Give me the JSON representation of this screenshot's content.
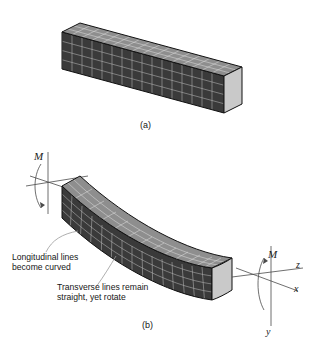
{
  "figure": {
    "background": "#ffffff",
    "captions": {
      "a": "(a)",
      "b": "(b)"
    },
    "annotations": {
      "longitudinal_line1": "Longitudinal lines",
      "longitudinal_line2": "become curved",
      "transverse_line1": "Transverse lines remain",
      "transverse_line2": "straight, yet rotate"
    },
    "moment_labels": {
      "left": "M",
      "right": "M"
    },
    "axes": {
      "z": "z",
      "x": "x",
      "y": "y"
    },
    "colors": {
      "dark_face": "#3b3b3b",
      "side_face": "#5a5a5a",
      "top_face": "#8e8e8e",
      "end_face": "#c9c9c9",
      "grid_line": "#d8d8d8",
      "outline": "#111111",
      "leader": "#9a9a9a",
      "text": "#161616"
    }
  }
}
